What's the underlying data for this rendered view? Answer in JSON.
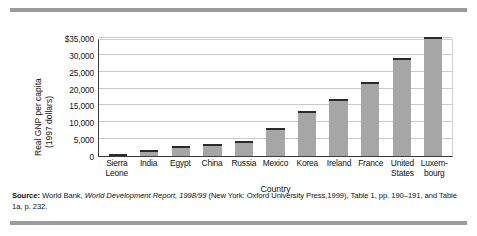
{
  "figure": {
    "y_axis_label_line1": "Real GNP per capita",
    "y_axis_label_line2": "(1997 dollars)",
    "x_axis_title": "Country",
    "source_prefix": "Source:",
    "source_part1": " World Bank, ",
    "source_italic": "World Development Report, 1998/99",
    "source_part2": " (New York: Oxford University Press,1999), Table 1, pp. 190–191,",
    "source_line2": "and Table 1a, p. 232."
  },
  "chart_data": {
    "type": "bar",
    "title": "",
    "xlabel": "Country",
    "ylabel": "Real GNP per capita (1997 dollars)",
    "ylim": [
      0,
      35000
    ],
    "yticks": [
      0,
      5000,
      10000,
      15000,
      20000,
      25000,
      30000,
      35000
    ],
    "ytick_labels": [
      "0",
      "5,000",
      "10,000",
      "15,000",
      "20,000",
      "25,000",
      "30,000",
      "$35,000"
    ],
    "grid": true,
    "legend": false,
    "bar_color": "#a6a6a6",
    "bar_top_color": "#2b2b2b",
    "categories": [
      "Sierra Leone",
      "India",
      "Egypt",
      "China",
      "Russia",
      "Mexico",
      "Korea",
      "Ireland",
      "France",
      "United States",
      "Luxembourg"
    ],
    "category_lines": [
      [
        "Sierra",
        "Leone"
      ],
      [
        "India"
      ],
      [
        "Egypt"
      ],
      [
        "China"
      ],
      [
        "Russia"
      ],
      [
        "Mexico"
      ],
      [
        "Korea"
      ],
      [
        "Ireland"
      ],
      [
        "France"
      ],
      [
        "United",
        "States"
      ],
      [
        "Luxem-",
        "bourg"
      ]
    ],
    "values": [
      410,
      1700,
      3080,
      3570,
      4370,
      8370,
      13500,
      17000,
      22030,
      29080,
      35300
    ]
  }
}
